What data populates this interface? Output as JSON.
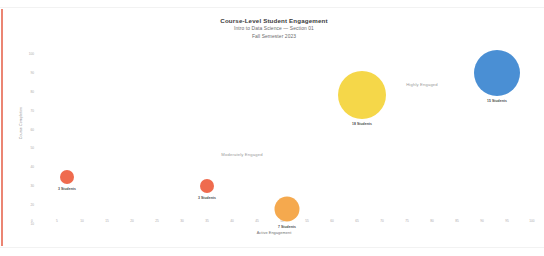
{
  "header": {
    "title": "Course-Level Student Engagement",
    "subtitle": "Intro to Data Science — Section 01",
    "subtitle2": "Fall Semester 2023"
  },
  "colors": {
    "accent_bar": "#e8705a",
    "low": "#ef6b4e",
    "medium": "#f5a94e",
    "high": "#f5d749",
    "highest": "#4a8fd4",
    "title_text": "#3a3a3a",
    "subtitle_text": "#6b6b6b",
    "tick_text": "#aaaaaa",
    "annotation_text": "#9a9a9a"
  },
  "chart_data": {
    "type": "scatter",
    "title": "Course-Level Student Engagement",
    "subtitle": "Intro to Data Science — Section 01",
    "xlabel": "Active Engagement",
    "ylabel": "Course Completion",
    "xlim": [
      0,
      100
    ],
    "ylim": [
      0,
      100
    ],
    "grid": false,
    "legend": "none",
    "x_ticks": [
      "0",
      "5",
      "10",
      "15",
      "20",
      "25",
      "30",
      "35",
      "40",
      "45",
      "50",
      "55",
      "60",
      "65",
      "70",
      "75",
      "80",
      "85",
      "90",
      "95",
      "100"
    ],
    "y_ticks": [
      "100",
      "90",
      "80",
      "70",
      "60",
      "50",
      "40",
      "30",
      "20",
      "10"
    ],
    "points": [
      {
        "name": "bubble-low-1",
        "x": 7,
        "y": 26,
        "size": 14,
        "color": "#ef6b4e",
        "label": "3 Students",
        "value": 3
      },
      {
        "name": "bubble-low-2",
        "x": 35,
        "y": 21,
        "size": 14,
        "color": "#ef6b4e",
        "label": "3 Students",
        "value": 3
      },
      {
        "name": "bubble-medium",
        "x": 51,
        "y": 8,
        "size": 25,
        "color": "#f5a94e",
        "label": "7 Students",
        "value": 7
      },
      {
        "name": "bubble-high",
        "x": 66,
        "y": 72,
        "size": 48,
        "color": "#f5d749",
        "label": "18 Students",
        "value": 18
      },
      {
        "name": "bubble-highest",
        "x": 93,
        "y": 84,
        "size": 46,
        "color": "#4a8fd4",
        "label": "15 Students",
        "value": 15
      }
    ],
    "annotations": [
      {
        "name": "zone-moderately-engaged",
        "text": "Moderately Engaged",
        "x": 42,
        "y": 39
      },
      {
        "name": "zone-highly-engaged",
        "text": "Highly Engaged",
        "x": 78,
        "y": 78
      }
    ]
  }
}
